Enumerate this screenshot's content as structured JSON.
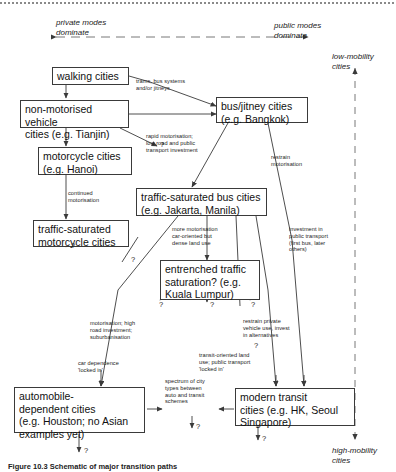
{
  "diagram": {
    "title_caption": "Figure 10.3   Schematic of major transition paths",
    "axis_labels": {
      "private": "private modes\ndominate",
      "public": "public modes\ndominate",
      "low_mobility": "low-mobility\ncities",
      "high_mobility": "high-mobility\ncities"
    },
    "boxes": [
      {
        "id": "walking",
        "label": "walking cities"
      },
      {
        "id": "non_motorised",
        "label": "non-motorised vehicle\ncities (e.g. Tianjin)"
      },
      {
        "id": "bus_jitney",
        "label": "bus/jitney cities\n(e.g. Bangkok)"
      },
      {
        "id": "motorcycle",
        "label": "motorcycle cities\n(e.g. Hanoi)"
      },
      {
        "id": "traffic_sat_bus",
        "label": "traffic-saturated bus cities\n(e.g. Jakarta, Manila)"
      },
      {
        "id": "traffic_sat_moto",
        "label": "traffic-saturated\nmotorcycle cities"
      },
      {
        "id": "entrenched",
        "label": "entrenched traffic\nsaturation? (e.g.\nKuala Lumpur)"
      },
      {
        "id": "automobile",
        "label": "automobile-\ndependent cities\n(e.g. Houston; no Asian\nexamples yet)"
      },
      {
        "id": "modern_transit",
        "label": "modern transit\ncities (e.g. HK, Seoul\nSingapore)"
      }
    ],
    "edge_notes": [
      {
        "id": "trams",
        "text": "trams, bus systems\nand/or jitneys"
      },
      {
        "id": "rapid_motorisation",
        "text": "rapid motorisation;\nlow road and public\ntransport investment"
      },
      {
        "id": "restrain",
        "text": "restrain\nmotorisation"
      },
      {
        "id": "continued",
        "text": "continued\nmotorisation"
      },
      {
        "id": "more_motorisation",
        "text": "more motorisation\ncar-oriented but\ndense land use"
      },
      {
        "id": "investment",
        "text": "investment in\npublic transport\n(first bus, later\nothers)"
      },
      {
        "id": "suburbanisation",
        "text": "motorisation; high\nroad investment;\nsuburbanisation"
      },
      {
        "id": "restrain_private",
        "text": "restrain private\nvehicle use, invest\nin alternatives"
      },
      {
        "id": "car_dependence",
        "text": "car dependence\n'locked in'"
      },
      {
        "id": "transit_oriented",
        "text": "transit-oriented land\nuse; public transport\n'locked in'"
      },
      {
        "id": "spectrum",
        "text": "spectrum of city\ntypes between\nauto and transit\nschemes"
      }
    ],
    "question_marks": [
      {
        "id": "q_nmv_right",
        "text": "?"
      },
      {
        "id": "q_tsm_down",
        "text": "?"
      },
      {
        "id": "q_diag_mid",
        "text": "?"
      },
      {
        "id": "q_entr_left",
        "text": "?"
      },
      {
        "id": "q_entr_mid",
        "text": "?"
      },
      {
        "id": "q_entr_right",
        "text": "?"
      },
      {
        "id": "q_restrain",
        "text": "?"
      },
      {
        "id": "q_spectrum",
        "text": "?"
      },
      {
        "id": "q_auto_down",
        "text": "?"
      },
      {
        "id": "q_transit_down",
        "text": "?"
      }
    ],
    "colors": {
      "line": "#3a3a3a",
      "text": "#1a1a1a",
      "dash": "#8a8a8a"
    }
  }
}
